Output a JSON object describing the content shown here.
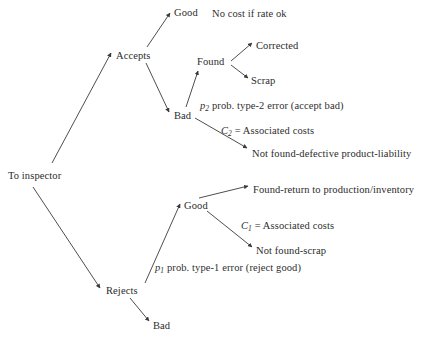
{
  "diagram": {
    "type": "decision-tree",
    "background_color": "#ffffff",
    "line_color": "#3a3a3a",
    "text_color": "#2b2b2b",
    "nodes": [
      {
        "id": "root",
        "label": "To inspector",
        "x": 8,
        "y": 170
      },
      {
        "id": "accepts",
        "label": "Accepts",
        "x": 116,
        "y": 50
      },
      {
        "id": "rejects",
        "label": "Rejects",
        "x": 106,
        "y": 285
      },
      {
        "id": "accepts-good",
        "label": "Good",
        "x": 174,
        "y": 7
      },
      {
        "id": "accepts-bad",
        "label": "Bad",
        "x": 174,
        "y": 110
      },
      {
        "id": "found",
        "label": "Found",
        "x": 197,
        "y": 56
      },
      {
        "id": "corrected",
        "label": "Corrected",
        "x": 256,
        "y": 40
      },
      {
        "id": "scrap",
        "label": "Scrap",
        "x": 251,
        "y": 75
      },
      {
        "id": "not-found-def",
        "label": "Not found-defective product-liability",
        "x": 252,
        "y": 148
      },
      {
        "id": "rejects-good",
        "label": "Good",
        "x": 184,
        "y": 200
      },
      {
        "id": "rejects-bad",
        "label": "Bad",
        "x": 153,
        "y": 320
      },
      {
        "id": "found-return",
        "label": "Found-return to production/inventory",
        "x": 253,
        "y": 184
      },
      {
        "id": "not-found-scrap",
        "label": "Not found-scrap",
        "x": 256,
        "y": 245
      }
    ],
    "annotations": [
      {
        "id": "no-cost",
        "text": "No cost if rate ok",
        "x": 212,
        "y": 8
      },
      {
        "id": "p2",
        "prefix": "p",
        "sub": "2",
        "text": " prob. type-2 error (accept bad)",
        "x": 200,
        "y": 100
      },
      {
        "id": "c2",
        "prefix": "C",
        "sub": "2",
        "text": " = Associated costs",
        "x": 221,
        "y": 125
      },
      {
        "id": "c1",
        "prefix": "C",
        "sub": "1",
        "text": " = Associated costs",
        "x": 241,
        "y": 220
      },
      {
        "id": "p1",
        "prefix": "p",
        "sub": "1",
        "text": " prob. type-1 error (reject good)",
        "x": 155,
        "y": 262
      }
    ],
    "edges": [
      {
        "id": "root-accepts",
        "from": "To inspector",
        "to": "Accepts",
        "x1": 52,
        "y1": 163,
        "x2": 111,
        "y2": 53
      },
      {
        "id": "root-rejects",
        "from": "To inspector",
        "to": "Rejects",
        "x1": 33,
        "y1": 187,
        "x2": 100,
        "y2": 288
      },
      {
        "id": "accepts-good",
        "from": "Accepts",
        "to": "Good",
        "x1": 147,
        "y1": 47,
        "x2": 170,
        "y2": 13
      },
      {
        "id": "accepts-bad",
        "from": "Accepts",
        "to": "Bad",
        "x1": 146,
        "y1": 63,
        "x2": 169,
        "y2": 112
      },
      {
        "id": "bad-found",
        "from": "Bad",
        "to": "Found",
        "x1": 186,
        "y1": 107,
        "x2": 198,
        "y2": 71
      },
      {
        "id": "found-corrected",
        "from": "Found",
        "to": "Corrected",
        "x1": 231,
        "y1": 61,
        "x2": 252,
        "y2": 43
      },
      {
        "id": "found-scrap",
        "from": "Found",
        "to": "Scrap",
        "x1": 231,
        "y1": 65,
        "x2": 248,
        "y2": 78
      },
      {
        "id": "bad-notfound",
        "from": "Bad",
        "to": "Not found-defective product-liability",
        "x1": 195,
        "y1": 118,
        "x2": 247,
        "y2": 148
      },
      {
        "id": "rejects-good",
        "from": "Rejects",
        "to": "Good",
        "x1": 145,
        "y1": 283,
        "x2": 180,
        "y2": 204
      },
      {
        "id": "rejects-bad",
        "from": "Rejects",
        "to": "Bad",
        "x1": 130,
        "y1": 298,
        "x2": 149,
        "y2": 321
      },
      {
        "id": "good-foundreturn",
        "from": "Good",
        "to": "Found-return to production/inventory",
        "x1": 199,
        "y1": 198,
        "x2": 248,
        "y2": 186
      },
      {
        "id": "good-notfoundscrap",
        "from": "Good",
        "to": "Not found-scrap",
        "x1": 207,
        "y1": 211,
        "x2": 252,
        "y2": 247
      }
    ]
  }
}
